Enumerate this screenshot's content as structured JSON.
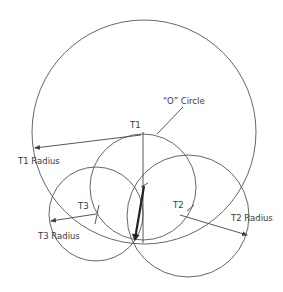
{
  "diagram": {
    "labels": {
      "o_circle": "“O” Circle",
      "t1": "T1",
      "t1_radius": "T1 Radius",
      "t2": "T2",
      "t2_radius": "T2 Radius",
      "t3": "T3",
      "t3_radius": "T3 Radius"
    },
    "colors": {
      "stroke": "#555555",
      "text": "#3a3a3a",
      "bold_arrow": "#222222"
    },
    "circles": {
      "o_circle": {
        "cx": 144,
        "cy": 132,
        "r": 112
      },
      "t1_circle": {
        "cx": 143,
        "cy": 187,
        "r": 53
      },
      "t2_circle": {
        "cx": 188,
        "cy": 216,
        "r": 61
      },
      "t3_circle": {
        "cx": 96,
        "cy": 214,
        "r": 47
      }
    }
  }
}
